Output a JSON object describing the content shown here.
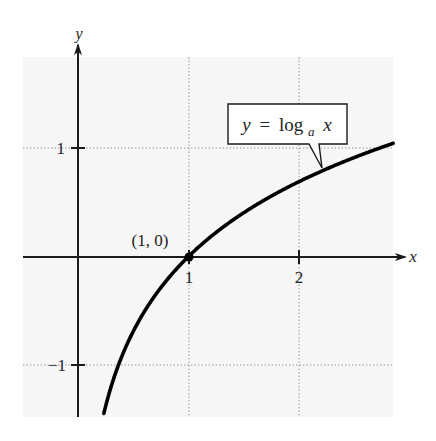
{
  "chart_data": {
    "type": "line",
    "title": "",
    "xlabel": "x",
    "ylabel": "y",
    "xlim": [
      -0.5,
      2.86
    ],
    "ylim": [
      -1.48,
      1.85
    ],
    "grid": true,
    "x_ticks": [
      {
        "value": 1,
        "label": "1"
      },
      {
        "value": 2,
        "label": "2"
      }
    ],
    "y_ticks": [
      {
        "value": 1,
        "label": "1"
      },
      {
        "value": -1,
        "label": "−1"
      }
    ],
    "series": [
      {
        "name": "y = log_a x",
        "function": "log_a(x), a ≈ e",
        "x": [
          0.24,
          0.3,
          0.4,
          0.5,
          0.6,
          0.8,
          1.0,
          1.25,
          1.5,
          2.0,
          2.5,
          2.86
        ],
        "y": [
          -1.43,
          -1.2,
          -0.92,
          -0.69,
          -0.51,
          -0.22,
          0.0,
          0.22,
          0.41,
          0.69,
          0.92,
          1.05
        ]
      }
    ],
    "annotations": [
      {
        "type": "point",
        "x": 1,
        "y": 0,
        "label": "(1, 0)"
      },
      {
        "type": "callout",
        "label_parts": {
          "lhs": "y",
          "eq": "=",
          "fn": "log",
          "sub": "a",
          "arg": "x"
        }
      }
    ],
    "colors": {
      "plot_background": "#f6f6f6",
      "grid": "#9a9a9a",
      "axis": "#1a1a1a",
      "curve": "#000000",
      "text": "#222222"
    }
  }
}
